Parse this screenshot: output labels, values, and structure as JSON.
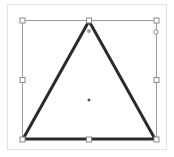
{
  "canvas": {
    "shape": "triangle",
    "stroke_color": "#2b2b2b",
    "stroke_width": 3,
    "fill_color": "#ffffff",
    "selection_color": "#9a9a9a",
    "handle_fill": "#ffffff",
    "handle_stroke": "#8a8a8a",
    "adjust_handle_color": "#a0a0a0",
    "center_dot_color": "#555555"
  }
}
